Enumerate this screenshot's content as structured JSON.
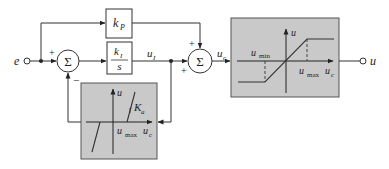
{
  "diagram": {
    "signals": {
      "input": "e",
      "integrator_output": "u",
      "integrator_output_sub": "I",
      "controller_output": "u",
      "controller_output_sub": "c",
      "output": "u"
    },
    "blocks": {
      "proportional": {
        "main": "k",
        "sub": "P"
      },
      "integral": {
        "num_main": "k",
        "num_sub": "I",
        "den": "s"
      },
      "summer1": {
        "symbol": "Σ",
        "sign_top": "+",
        "sign_bottom": "−"
      },
      "summer2": {
        "symbol": "Σ",
        "sign_top": "+",
        "sign_left": "+"
      }
    },
    "saturation_block": {
      "y_axis": "u",
      "x_axis_main": "u",
      "x_axis_sub": "c",
      "umin_main": "u",
      "umin_sub": "min",
      "umax_main": "u",
      "umax_sub": "max"
    },
    "deadzone_block": {
      "y_axis": "u",
      "x_axis_main": "u",
      "x_axis_sub": "c",
      "umax_main": "u",
      "umax_sub": "max",
      "slope_main": "K",
      "slope_sub": "a"
    },
    "colors": {
      "gray_block": "#c9c9c9",
      "line": "#333333",
      "background": "#ffffff"
    }
  }
}
